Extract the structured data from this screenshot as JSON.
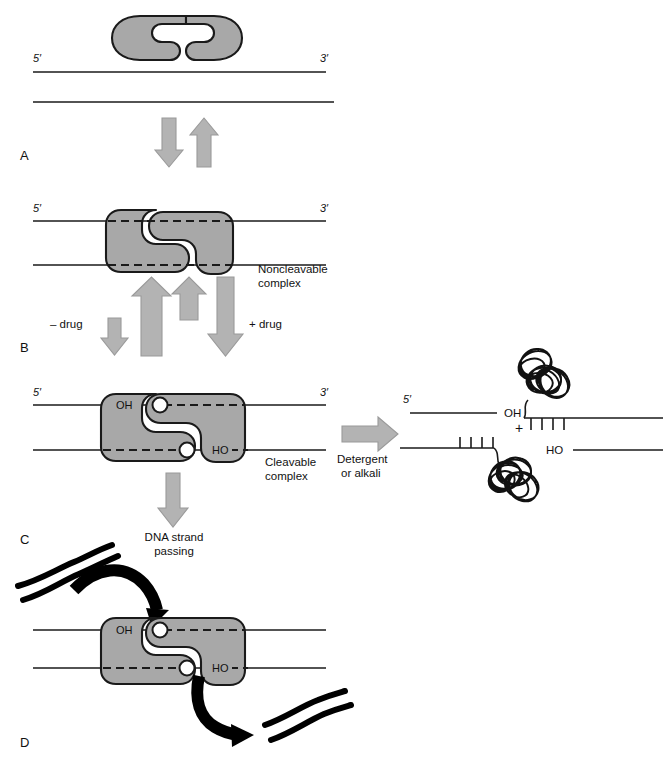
{
  "figure": {
    "type": "biology-mechanism-diagram",
    "enzyme_fill": "#a8a8a8",
    "enzyme_stroke": "#1a1a1a",
    "arrow_fill": "#b3b3b3",
    "arrow_stroke": "#8c8c8c",
    "dna_stroke": "#1a1a1a",
    "background": "#ffffff"
  },
  "panels": [
    {
      "id": "A",
      "letter": "A"
    },
    {
      "id": "B",
      "letter": "B"
    },
    {
      "id": "C",
      "letter": "C"
    },
    {
      "id": "D",
      "letter": "D"
    }
  ],
  "panel_a": {
    "five_prime": "5′",
    "three_prime": "3′"
  },
  "panel_b": {
    "five_prime": "5′",
    "three_prime": "3′",
    "complex_label_line1": "Noncleavable",
    "complex_label_line2": "complex",
    "minus_drug": "– drug",
    "plus_drug": "+ drug"
  },
  "panel_c": {
    "five_prime": "5′",
    "three_prime": "3′",
    "oh_left": "OH",
    "ho_right": "HO",
    "complex_label_line1": "Cleavable",
    "complex_label_line2": "complex",
    "down_arrow_label_line1": "DNA strand",
    "down_arrow_label_line2": "passing",
    "treatment_line1": "Detergent",
    "treatment_line2": "or alkali",
    "products": {
      "five_prime": "5′",
      "oh": "OH",
      "plus": "+",
      "ho": "HO"
    }
  },
  "panel_d": {
    "oh_left": "OH",
    "ho_right": "HO"
  }
}
